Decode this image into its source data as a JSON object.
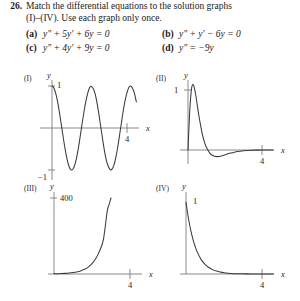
{
  "exercise": {
    "number": "26.",
    "prompt_line1": "Match the differential equations to the solution graphs",
    "prompt_line2": "(I)–(IV). Use each graph only once."
  },
  "choices": [
    {
      "label": "(a)",
      "equation": "y″ + 5y′ + 6y = 0"
    },
    {
      "label": "(b)",
      "equation": "y″ + y′ − 6y = 0"
    },
    {
      "label": "(c)",
      "equation": "y″ + 4y′ + 9y = 0"
    },
    {
      "label": "(d)",
      "equation": "y″ = −9y"
    }
  ],
  "graphs": [
    {
      "roman": "(I)",
      "ylabel": "y",
      "xlabel": "x",
      "ytick_top": "1",
      "ytick_bottom": "−1",
      "xtick": "4"
    },
    {
      "roman": "(II)",
      "ylabel": "y",
      "xlabel": "x",
      "ytick_top": "1",
      "xtick": "4"
    },
    {
      "roman": "(III)",
      "ylabel": "y",
      "xlabel": "x",
      "ytick_top": "400",
      "xtick": "4"
    },
    {
      "roman": "(IV)",
      "ylabel": "y",
      "xlabel": "x",
      "ytick_top": "1",
      "xtick": "4"
    }
  ],
  "chart_data": [
    {
      "type": "line",
      "id": "I",
      "title": "(I)",
      "xlabel": "x",
      "ylabel": "y",
      "xlim": [
        0,
        4.6
      ],
      "ylim": [
        -1.35,
        1.35
      ],
      "xticks": [
        4
      ],
      "yticks": [
        -1,
        1
      ],
      "grid": false,
      "legend": false,
      "function": "cos(3x)",
      "description": "Undamped oscillation, amplitude 1, roughly two periods over 0 to 4",
      "x": [
        0,
        0.1,
        0.2,
        0.3,
        0.4,
        0.5,
        0.6,
        0.7,
        0.8,
        0.9,
        1.0,
        1.1,
        1.2,
        1.3,
        1.4,
        1.5,
        1.6,
        1.7,
        1.8,
        1.9,
        2.0,
        2.1,
        2.2,
        2.3,
        2.4,
        2.5,
        2.6,
        2.7,
        2.8,
        2.9,
        3.0,
        3.1,
        3.2,
        3.3,
        3.4,
        3.5,
        3.6,
        3.7,
        3.8,
        3.9,
        4.0,
        4.1,
        4.2,
        4.3,
        4.4,
        4.5
      ],
      "y": [
        1.0,
        0.955,
        0.825,
        0.622,
        0.362,
        0.071,
        -0.227,
        -0.505,
        -0.737,
        -0.905,
        -0.99,
        -0.988,
        -0.898,
        -0.729,
        -0.497,
        -0.21,
        0.09,
        0.37,
        0.62,
        0.82,
        0.96,
        0.99,
        0.94,
        0.81,
        0.6,
        0.33,
        0.03,
        -0.27,
        -0.55,
        -0.77,
        -0.91,
        -0.99,
        -0.98,
        -0.89,
        -0.71,
        -0.47,
        -0.18,
        0.12,
        0.41,
        0.66,
        0.84,
        0.97,
        1.0,
        0.94,
        0.82,
        0.62
      ]
    },
    {
      "type": "line",
      "id": "II",
      "title": "(II)",
      "xlabel": "x",
      "ylabel": "y",
      "xlim": [
        0,
        4.6
      ],
      "ylim": [
        -0.35,
        1.35
      ],
      "xticks": [
        4
      ],
      "yticks": [
        1
      ],
      "grid": false,
      "legend": false,
      "function": "e^(-2x) sin(sqrt(5) x) scaled",
      "description": "Damped oscillation: sharp rise to a peak slightly above 1, rapid decay, small dip below the axis, then flattens to zero",
      "x": [
        0,
        0.1,
        0.2,
        0.3,
        0.4,
        0.5,
        0.6,
        0.7,
        0.8,
        0.9,
        1.0,
        1.2,
        1.4,
        1.6,
        1.8,
        2.0,
        2.2,
        2.4,
        2.6,
        2.8,
        3.0,
        3.4,
        3.8,
        4.2,
        4.6
      ],
      "y": [
        0.0,
        0.68,
        1.04,
        1.08,
        0.95,
        0.75,
        0.55,
        0.38,
        0.23,
        0.12,
        0.04,
        -0.06,
        -0.1,
        -0.11,
        -0.1,
        -0.08,
        -0.06,
        -0.045,
        -0.03,
        -0.02,
        -0.013,
        -0.005,
        -0.002,
        -0.001,
        0.0
      ]
    },
    {
      "type": "line",
      "id": "III",
      "title": "(III)",
      "xlabel": "x",
      "ylabel": "y",
      "xlim": [
        0,
        4.6
      ],
      "ylim": [
        0,
        430
      ],
      "xticks": [
        4
      ],
      "yticks": [
        400
      ],
      "grid": false,
      "legend": false,
      "function": "e^(2x)",
      "description": "Exponential growth, near zero until about x = 2, rising steeply to 400",
      "x": [
        0,
        0.2,
        0.4,
        0.6,
        0.8,
        1.0,
        1.2,
        1.4,
        1.6,
        1.8,
        2.0,
        2.2,
        2.4,
        2.6,
        2.8,
        2.9,
        3.0
      ],
      "y": [
        1,
        1.5,
        2.2,
        3.3,
        5,
        7.4,
        11,
        16.4,
        24.5,
        36.6,
        54.6,
        81.5,
        121.5,
        181,
        330,
        365,
        400
      ]
    },
    {
      "type": "line",
      "id": "IV",
      "title": "(IV)",
      "xlabel": "x",
      "ylabel": "y",
      "xlim": [
        0,
        4.6
      ],
      "ylim": [
        0,
        1.2
      ],
      "xticks": [
        4
      ],
      "yticks": [
        1
      ],
      "grid": false,
      "legend": false,
      "function": "e^(-2x)",
      "description": "Exponential decay from 1 to zero, flattening by about x = 2.5",
      "x": [
        0,
        0.1,
        0.2,
        0.3,
        0.4,
        0.5,
        0.6,
        0.8,
        1.0,
        1.2,
        1.4,
        1.6,
        1.8,
        2.0,
        2.4,
        2.8,
        3.2,
        3.6,
        4.0,
        4.6
      ],
      "y": [
        1.0,
        0.82,
        0.67,
        0.55,
        0.45,
        0.37,
        0.3,
        0.2,
        0.135,
        0.09,
        0.061,
        0.041,
        0.027,
        0.018,
        0.008,
        0.004,
        0.0017,
        0.0007,
        0.0003,
        0.0001
      ]
    }
  ]
}
